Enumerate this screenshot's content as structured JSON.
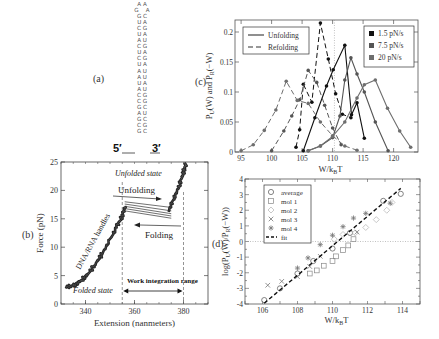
{
  "panels": {
    "a": {
      "label": "(a)"
    },
    "b": {
      "label": "(b)"
    },
    "c": {
      "label": "(c)"
    },
    "d": {
      "label": "(d)"
    }
  },
  "hairpin": {
    "loop_top": "A A",
    "loop_mid": "G    A",
    "pairs": [
      "GC",
      "UA",
      "CG",
      "UA",
      "AU",
      "CG",
      "UA",
      "CG",
      "UA",
      "AU",
      "AU",
      "UA",
      "AU",
      "CG",
      "CG",
      "GC",
      "AU",
      "GC",
      "CG",
      "GC"
    ],
    "end5": "5′",
    "end3": "3′"
  },
  "chart_data": [
    {
      "id": "b",
      "type": "scatter",
      "title": "",
      "xlabel": "Extension (nanmeters)",
      "ylabel": "Force (pN)",
      "xlim": [
        330,
        390
      ],
      "ylim": [
        0,
        25
      ],
      "xticks": [
        340,
        360,
        380
      ],
      "yticks": [
        0,
        5,
        10,
        15,
        20,
        25
      ],
      "annotations": [
        "Unfolded state",
        "Unfolding",
        "Folding",
        "DNA/RNA handles",
        "Folded state",
        "Work integration range"
      ],
      "work_integration_range": [
        355,
        380
      ],
      "series": [
        {
          "name": "handle stretch (folded)",
          "x": [
            332,
            335,
            338,
            341,
            344,
            347,
            350,
            353,
            355,
            356.5
          ],
          "y": [
            3,
            3.2,
            4,
            5.3,
            7,
            9,
            11.3,
            13.8,
            15.5,
            17.5
          ]
        },
        {
          "name": "unfolded stretch",
          "x": [
            374,
            376,
            378,
            379.5,
            380.5,
            381
          ],
          "y": [
            16.5,
            18.5,
            20.5,
            22.5,
            24,
            24.8
          ]
        },
        {
          "name": "rip traces",
          "x": [
            356,
            375
          ],
          "y": [
            [
              18,
              17
            ],
            [
              17.6,
              16.4
            ],
            [
              17.2,
              15.9
            ],
            [
              16.8,
              15.5
            ],
            [
              16.4,
              15.1
            ]
          ]
        }
      ]
    },
    {
      "id": "c",
      "type": "line",
      "title": "",
      "xlabel": "W/k_BT",
      "ylabel": "P_U(W) and P_R(−W)",
      "xlim": [
        94,
        124
      ],
      "ylim": [
        0,
        0.22
      ],
      "xticks": [
        95,
        100,
        105,
        110,
        115,
        120
      ],
      "yticks": [
        0,
        0.05,
        0.1,
        0.15,
        0.2
      ],
      "yticklabels": [
        "0",
        "0.05",
        "0.1",
        "0.15",
        "0.2"
      ],
      "vline": 110.3,
      "legend_style": [
        {
          "label": "Unfolding",
          "dash": "solid"
        },
        {
          "label": "Refolding",
          "dash": "dashed"
        }
      ],
      "legend_rates": [
        {
          "label": "1.5 pN/s",
          "color": "#111111"
        },
        {
          "label": "7.5 pN/s",
          "color": "#555555"
        },
        {
          "label": "20 pN/s",
          "color": "#6e6e6e"
        }
      ],
      "series": [
        {
          "name": "1.5 pN/s unfolding",
          "dash": "solid",
          "color": "#111111",
          "x": [
            105.2,
            107.1,
            109,
            110.1,
            112,
            113.1,
            114,
            115.2
          ],
          "y": [
            0.002,
            0.057,
            0.11,
            0.137,
            0.178,
            0.062,
            0.082,
            0.023
          ]
        },
        {
          "name": "1.5 pN/s refolding",
          "dash": "dashed",
          "color": "#111111",
          "x": [
            104,
            104.6,
            105.2,
            106.6,
            108,
            109.3,
            110.5,
            111.6,
            113
          ],
          "y": [
            0.008,
            0.037,
            0.113,
            0.083,
            0.215,
            0.155,
            0.097,
            0.063,
            0.057
          ]
        },
        {
          "name": "7.5 pN/s unfolding",
          "dash": "solid",
          "color": "#555555",
          "x": [
            106,
            108,
            110,
            111.2,
            112,
            113,
            114,
            115.2,
            117,
            119.1
          ],
          "y": [
            0.002,
            0.01,
            0.024,
            0.06,
            0.12,
            0.157,
            0.13,
            0.1,
            0.05,
            0.002
          ]
        },
        {
          "name": "7.5 pN/s refolding",
          "dash": "dashed",
          "color": "#555555",
          "x": [
            100,
            102,
            103.3,
            104.6,
            106,
            107.4,
            108.7,
            110,
            111.4
          ],
          "y": [
            0.002,
            0.035,
            0.06,
            0.087,
            0.136,
            0.116,
            0.078,
            0.04,
            0.012
          ]
        },
        {
          "name": "20 pN/s unfolding",
          "dash": "solid",
          "color": "#6e6e6e",
          "x": [
            106,
            108,
            110,
            112,
            114,
            115.2,
            117,
            119,
            121,
            122.8
          ],
          "y": [
            0.002,
            0.01,
            0.026,
            0.05,
            0.09,
            0.112,
            0.12,
            0.073,
            0.035,
            0.008
          ]
        },
        {
          "name": "20 pN/s refolding",
          "dash": "dashed",
          "color": "#6e6e6e",
          "x": [
            95,
            97,
            98.8,
            100.7,
            102.4,
            104.2,
            106,
            108,
            110,
            112,
            114
          ],
          "y": [
            0.002,
            0.012,
            0.036,
            0.07,
            0.118,
            0.086,
            0.081,
            0.05,
            0.027,
            0.01,
            0.003
          ]
        }
      ]
    },
    {
      "id": "d",
      "type": "scatter",
      "title": "",
      "xlabel": "W/k_BT",
      "ylabel": "log(P_U(W)/P_R(−W))",
      "xlim": [
        105,
        115
      ],
      "ylim": [
        -4,
        4
      ],
      "xticks": [
        106,
        108,
        110,
        112,
        114
      ],
      "yticks": [
        -4,
        -3,
        -2,
        -1,
        0,
        1,
        2,
        3,
        4
      ],
      "hline": 0,
      "legend": [
        "average",
        "mol 1",
        "mol 2",
        "mol 3",
        "mol 4",
        "fit"
      ],
      "series": [
        {
          "name": "average",
          "marker": "circle",
          "x": [
            106.1,
            107,
            108,
            108.9,
            110,
            111,
            112.9,
            113.9
          ],
          "y": [
            -3.75,
            -3.0,
            -2.05,
            -1.25,
            -0.45,
            0.55,
            2.6,
            3.05
          ]
        },
        {
          "name": "mol 1",
          "marker": "square",
          "x": [
            108.7,
            109.1,
            109.5,
            110,
            110.2,
            110.6,
            110.9,
            111.2
          ],
          "y": [
            -2.05,
            -1.85,
            -1.55,
            -1.25,
            -0.95,
            -0.55,
            -0.25,
            0.15
          ]
        },
        {
          "name": "mol 2",
          "marker": "diamond",
          "x": [
            110.1,
            110.6,
            111.3,
            111.9,
            112.5,
            113.1,
            113.4
          ],
          "y": [
            0.15,
            0.45,
            0.55,
            0.9,
            1.4,
            2.0,
            2.5
          ]
        },
        {
          "name": "mol 3",
          "marker": "x",
          "x": [
            106.3,
            107.1,
            108,
            108.7,
            109.3,
            111.4
          ],
          "y": [
            -2.8,
            -2.55,
            -2.25,
            -1.6,
            -0.95,
            0.6
          ]
        },
        {
          "name": "mol 4",
          "marker": "star",
          "x": [
            108,
            108.6,
            109.3,
            110,
            110.6,
            111.2,
            111.9,
            113.3
          ],
          "y": [
            -1.7,
            -1.05,
            -0.2,
            0.4,
            0.95,
            1.5,
            1.8,
            2.45
          ]
        },
        {
          "name": "fit",
          "marker": "dashed-line",
          "x": [
            106.1,
            113.9
          ],
          "y": [
            -3.95,
            3.4
          ]
        }
      ]
    }
  ]
}
